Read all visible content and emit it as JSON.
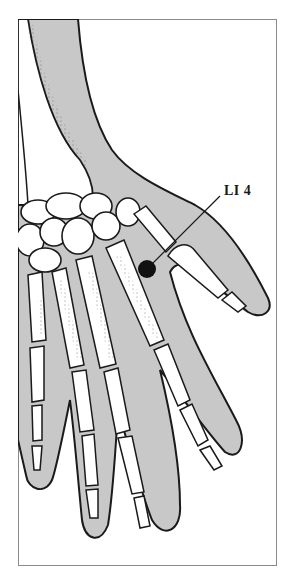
{
  "figure": {
    "point_label": "LI 4",
    "colors": {
      "skin": "#c8c8c8",
      "outline": "#1a1a1a",
      "bone": "#ffffff",
      "point": "#111111",
      "frame": "#8a8a8a"
    }
  }
}
